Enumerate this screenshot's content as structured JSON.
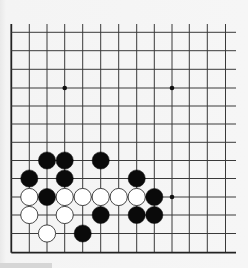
{
  "board": {
    "description": "Partial Go board (bottom-left corner region)",
    "columns": 13,
    "rows": 13,
    "visible_edges": [
      "left",
      "bottom"
    ],
    "col_x": [
      11.3,
      29.3,
      47.0,
      64.7,
      82.7,
      100.7,
      118.7,
      136.7,
      154.3,
      172.0,
      189.3,
      207.3,
      225.5
    ],
    "row_y": [
      32.3,
      50.7,
      69.3,
      88.0,
      106.0,
      124.0,
      142.3,
      160.5,
      178.5,
      197.0,
      215.0,
      233.5,
      252.7
    ],
    "grid_top_y": 24,
    "grid_right_x": 236,
    "line_color": "#3a3a3a",
    "edge_line_color": "#222222",
    "stone_radius": 8.6,
    "star_points": [
      {
        "col": 3,
        "row": 3
      },
      {
        "col": 9,
        "row": 3
      },
      {
        "col": 9,
        "row": 9
      }
    ],
    "stones": [
      {
        "color": "black",
        "col": 2,
        "row": 7
      },
      {
        "color": "black",
        "col": 3,
        "row": 7
      },
      {
        "color": "black",
        "col": 5,
        "row": 7
      },
      {
        "color": "black",
        "col": 1,
        "row": 8
      },
      {
        "color": "black",
        "col": 3,
        "row": 8
      },
      {
        "color": "black",
        "col": 7,
        "row": 8
      },
      {
        "color": "white",
        "col": 1,
        "row": 9
      },
      {
        "color": "black",
        "col": 2,
        "row": 9
      },
      {
        "color": "white",
        "col": 3,
        "row": 9
      },
      {
        "color": "white",
        "col": 4,
        "row": 9
      },
      {
        "color": "white",
        "col": 5,
        "row": 9
      },
      {
        "color": "white",
        "col": 6,
        "row": 9
      },
      {
        "color": "white",
        "col": 7,
        "row": 9
      },
      {
        "color": "black",
        "col": 8,
        "row": 9
      },
      {
        "color": "white",
        "col": 1,
        "row": 10
      },
      {
        "color": "white",
        "col": 3,
        "row": 10
      },
      {
        "color": "black",
        "col": 5,
        "row": 10
      },
      {
        "color": "black",
        "col": 7,
        "row": 10
      },
      {
        "color": "black",
        "col": 8,
        "row": 10
      },
      {
        "color": "white",
        "col": 2,
        "row": 11
      },
      {
        "color": "black",
        "col": 4,
        "row": 11
      }
    ],
    "colors": {
      "black_stone": "#0a0a0a",
      "white_stone": "#ffffff",
      "white_stone_outline": "#333333",
      "background": "#f5f5f5"
    }
  }
}
